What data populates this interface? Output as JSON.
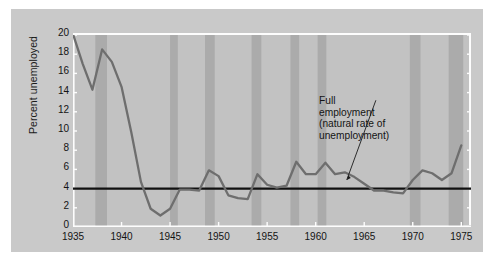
{
  "chart_data": {
    "type": "line",
    "title": "",
    "xlabel": "",
    "ylabel": "Percent unemployed",
    "xlim": [
      1935,
      1976
    ],
    "ylim": [
      0,
      20
    ],
    "grid": false,
    "legend": "none",
    "x_ticks": [
      1935,
      1940,
      1945,
      1950,
      1955,
      1960,
      1965,
      1970,
      1975
    ],
    "y_ticks": [
      0,
      2,
      4,
      6,
      8,
      10,
      12,
      14,
      16,
      18,
      20
    ],
    "series": [
      {
        "name": "Percent unemployed",
        "color": "#6e6e6e",
        "x": [
          1935,
          1936,
          1937,
          1938,
          1939,
          1940,
          1941,
          1942,
          1943,
          1944,
          1945,
          1946,
          1947,
          1948,
          1949,
          1950,
          1951,
          1952,
          1953,
          1954,
          1955,
          1956,
          1957,
          1958,
          1959,
          1960,
          1961,
          1962,
          1963,
          1964,
          1965,
          1966,
          1967,
          1968,
          1969,
          1970,
          1971,
          1972,
          1973,
          1974,
          1975
        ],
        "values": [
          20.1,
          17.0,
          14.3,
          18.5,
          17.2,
          14.6,
          9.9,
          4.7,
          1.9,
          1.2,
          1.9,
          3.9,
          3.9,
          3.8,
          5.9,
          5.3,
          3.3,
          3.0,
          2.9,
          5.5,
          4.4,
          4.1,
          4.3,
          6.8,
          5.5,
          5.5,
          6.7,
          5.5,
          5.7,
          5.2,
          4.5,
          3.8,
          3.8,
          3.6,
          3.5,
          4.9,
          5.9,
          5.6,
          4.9,
          5.6,
          8.5
        ]
      },
      {
        "name": "Full employment (natural rate of unemployment)",
        "color": "#111111",
        "type": "hline",
        "value": 4.0
      }
    ],
    "recession_bands": [
      {
        "start": 1937.3,
        "end": 1938.5
      },
      {
        "start": 1945.0,
        "end": 1945.8
      },
      {
        "start": 1948.6,
        "end": 1949.6
      },
      {
        "start": 1953.4,
        "end": 1954.4
      },
      {
        "start": 1957.4,
        "end": 1958.3
      },
      {
        "start": 1960.2,
        "end": 1961.1
      },
      {
        "start": 1969.7,
        "end": 1970.8
      },
      {
        "start": 1973.7,
        "end": 1975.2
      }
    ],
    "band_color": "#ababab",
    "panel_color": "#c2c2c2",
    "card_color": "#c9c9c9",
    "annotation": {
      "lines": [
        "Full",
        "employment",
        "(natural rate of",
        "unemployment)"
      ],
      "text": "Full employment (natural rate of unemployment)",
      "points_to_value": 4.0
    }
  }
}
